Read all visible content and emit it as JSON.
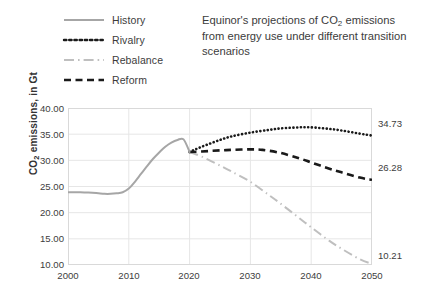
{
  "title": {
    "line1": "Equinor's projections of CO",
    "sub1": "2",
    "line2": " emissions from energy use under different transition scenarios",
    "full": "Equinor's projections of CO2 emissions from energy use under different transition scenarios"
  },
  "legend": {
    "position": "top-left",
    "items": [
      {
        "label": "History",
        "style": "solid",
        "color": "#a6a6a6"
      },
      {
        "label": "Rivalry",
        "style": "dotted",
        "color": "#1a1a1a"
      },
      {
        "label": "Rebalance",
        "style": "dashdot",
        "color": "#bfbfbf"
      },
      {
        "label": "Reform",
        "style": "dashed",
        "color": "#1a1a1a"
      }
    ]
  },
  "axes": {
    "y_title_pre": "CO",
    "y_title_sub": "2",
    "y_title_post": " emissions, in Gt",
    "y_title_full": "CO2 emissions, in Gt",
    "x_title": "Year",
    "y_ticks": [
      "40.00",
      "35.00",
      "30.00",
      "25.00",
      "20.00",
      "15.00",
      "10.00"
    ],
    "x_ticks": [
      "2000",
      "2010",
      "2020",
      "2030",
      "2040",
      "2050"
    ]
  },
  "end_labels": {
    "rivalry": "34.73",
    "reform": "26.28",
    "rebalance": "10.21"
  },
  "chart_data": {
    "type": "line",
    "title": "Equinor's projections of CO2 emissions from energy use under different transition scenarios",
    "xlabel": "Year",
    "ylabel": "CO2 emissions, in Gt",
    "xlim": [
      2000,
      2050
    ],
    "ylim": [
      10.0,
      40.0
    ],
    "grid": true,
    "legend_position": "top-left",
    "series": [
      {
        "name": "History",
        "style": "solid",
        "color": "#a6a6a6",
        "x": [
          2000,
          2001,
          2002,
          2003,
          2004,
          2005,
          2006,
          2007,
          2008,
          2009,
          2010,
          2011,
          2012,
          2013,
          2014,
          2015,
          2016,
          2017,
          2018,
          2019,
          2020
        ],
        "values": [
          23.9,
          23.9,
          23.9,
          23.85,
          23.8,
          23.7,
          23.6,
          23.6,
          23.7,
          23.9,
          24.6,
          25.9,
          27.4,
          28.9,
          30.3,
          31.5,
          32.6,
          33.4,
          33.9,
          34.0,
          31.6
        ]
      },
      {
        "name": "Rivalry",
        "style": "dotted",
        "color": "#1a1a1a",
        "x": [
          2020,
          2022,
          2025,
          2027,
          2030,
          2033,
          2035,
          2038,
          2040,
          2043,
          2045,
          2048,
          2050
        ],
        "values": [
          31.6,
          32.6,
          33.9,
          34.6,
          35.3,
          35.8,
          36.1,
          36.3,
          36.3,
          36.0,
          35.7,
          35.1,
          34.73
        ]
      },
      {
        "name": "Reform",
        "style": "dashed",
        "color": "#1a1a1a",
        "x": [
          2020,
          2022,
          2025,
          2027,
          2030,
          2032,
          2035,
          2038,
          2040,
          2043,
          2045,
          2048,
          2050
        ],
        "values": [
          31.6,
          31.7,
          31.9,
          32.0,
          32.1,
          32.0,
          31.4,
          30.4,
          29.6,
          28.4,
          27.7,
          26.7,
          26.28
        ]
      },
      {
        "name": "Rebalance",
        "style": "dashdot",
        "color": "#bfbfbf",
        "x": [
          2020,
          2022,
          2025,
          2027,
          2030,
          2033,
          2035,
          2038,
          2040,
          2043,
          2045,
          2048,
          2050
        ],
        "values": [
          31.6,
          30.7,
          29.0,
          27.8,
          25.9,
          23.4,
          21.7,
          19.0,
          17.2,
          14.6,
          13.1,
          11.1,
          10.21
        ]
      }
    ]
  }
}
